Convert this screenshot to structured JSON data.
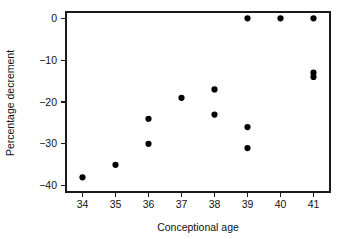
{
  "chart_data": {
    "type": "scatter",
    "title": "",
    "xlabel": "Conceptional age",
    "ylabel": "Percentage decrement",
    "xlim": [
      33.5,
      41.5
    ],
    "ylim": [
      -41.5,
      1.5
    ],
    "xticks": [
      34,
      35,
      36,
      37,
      38,
      39,
      40,
      41
    ],
    "xtick_labels": [
      "34",
      "35",
      "36",
      "37",
      "38",
      "39",
      "40",
      "41"
    ],
    "yticks": [
      0,
      -10,
      -20,
      -30,
      -40
    ],
    "ytick_labels": [
      "0",
      "-10",
      "-20",
      "-30",
      "-40"
    ],
    "grid": false,
    "legend": null,
    "marker": "filled-circle",
    "marker_color": "#000000",
    "points": [
      {
        "x": 34,
        "y": -38
      },
      {
        "x": 35,
        "y": -35
      },
      {
        "x": 36,
        "y": -24
      },
      {
        "x": 36,
        "y": -30
      },
      {
        "x": 37,
        "y": -19
      },
      {
        "x": 38,
        "y": -17
      },
      {
        "x": 38,
        "y": -23
      },
      {
        "x": 39,
        "y": 0
      },
      {
        "x": 39,
        "y": -26
      },
      {
        "x": 39,
        "y": -31
      },
      {
        "x": 40,
        "y": 0
      },
      {
        "x": 41,
        "y": 0
      },
      {
        "x": 41,
        "y": -13
      },
      {
        "x": 41,
        "y": -14
      }
    ]
  },
  "axes": {
    "x_title": "Conceptional age",
    "y_title": "Percentage decrement"
  }
}
